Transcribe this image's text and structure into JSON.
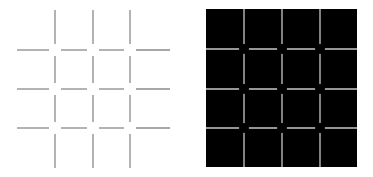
{
  "figure": {
    "left_panel": {
      "background": "#ffffff",
      "line_color": "#8a8a8a",
      "vertical_x": [
        55,
        93,
        130
      ],
      "horizontal_y": [
        50,
        89,
        128
      ],
      "extent": {
        "x0": 17,
        "x1": 170,
        "y0": 10,
        "y1": 168
      },
      "gap": 6
    },
    "right_panel": {
      "background": "#000000",
      "line_color": "#c8c8c8",
      "rect": {
        "x0": 206,
        "y0": 9,
        "x1": 357,
        "y1": 167
      },
      "vertical_x": [
        244,
        282,
        320
      ],
      "horizontal_y": [
        49,
        89,
        128
      ],
      "intersection_spot_color": "#000000",
      "spot_radius": 5
    }
  }
}
